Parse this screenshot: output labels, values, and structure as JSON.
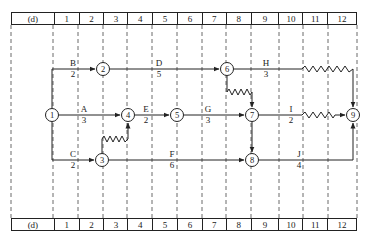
{
  "time_scale": {
    "unit_label": "(d)",
    "ticks": [
      "1",
      "2",
      "3",
      "4",
      "5",
      "6",
      "7",
      "8",
      "9",
      "10",
      "11",
      "12"
    ]
  },
  "nodes": [
    {
      "id": "1",
      "label": "1"
    },
    {
      "id": "2",
      "label": "2"
    },
    {
      "id": "3",
      "label": "3"
    },
    {
      "id": "4",
      "label": "4"
    },
    {
      "id": "5",
      "label": "5"
    },
    {
      "id": "6",
      "label": "6"
    },
    {
      "id": "7",
      "label": "7"
    },
    {
      "id": "8",
      "label": "8"
    },
    {
      "id": "9",
      "label": "9"
    }
  ],
  "activities": [
    {
      "name": "A",
      "duration": "3",
      "from": "1",
      "to": "4"
    },
    {
      "name": "B",
      "duration": "2",
      "from": "1",
      "to": "2"
    },
    {
      "name": "C",
      "duration": "2",
      "from": "1",
      "to": "3"
    },
    {
      "name": "D",
      "duration": "5",
      "from": "2",
      "to": "6"
    },
    {
      "name": "E",
      "duration": "2",
      "from": "4",
      "to": "5"
    },
    {
      "name": "F",
      "duration": "6",
      "from": "3",
      "to": "8"
    },
    {
      "name": "G",
      "duration": "3",
      "from": "5",
      "to": "7"
    },
    {
      "name": "H",
      "duration": "3",
      "from": "6",
      "to": "9"
    },
    {
      "name": "I",
      "duration": "2",
      "from": "7",
      "to": "9"
    },
    {
      "name": "J",
      "duration": "4",
      "from": "8",
      "to": "9"
    }
  ],
  "dummy_activities": [
    {
      "from": "3",
      "to": "4"
    },
    {
      "from": "6",
      "to": "7"
    }
  ],
  "colors": {
    "line": "#222222",
    "grid": "#444444",
    "background": "#ffffff"
  }
}
